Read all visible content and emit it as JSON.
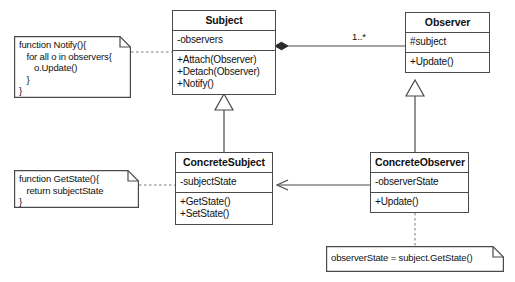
{
  "diagram": {
    "stroke_color": "#4a4a4a",
    "text_color": "#111111",
    "background": "#ffffff"
  },
  "classes": [
    {
      "key": "subject",
      "name": "Subject",
      "attributes": [
        "-observers"
      ],
      "operations": [
        "+Attach(Observer)",
        "+Detach(Observer)",
        "+Notify()"
      ]
    },
    {
      "key": "observer",
      "name": "Observer",
      "attributes": [
        "#subject"
      ],
      "operations": [
        "+Update()"
      ]
    },
    {
      "key": "concrete_subject",
      "name": "ConcreteSubject",
      "attributes": [
        "-subjectState"
      ],
      "operations": [
        "+GetState()",
        "+SetState()"
      ]
    },
    {
      "key": "concrete_observer",
      "name": "ConcreteObserver",
      "attributes": [
        "-observerState"
      ],
      "operations": [
        "+Update()"
      ]
    }
  ],
  "notes": [
    {
      "key": "notify_note",
      "text": "function Notify(){\n   for all o in observers{\n      o.Update()\n   }\n}"
    },
    {
      "key": "getstate_note",
      "text": "function GetState(){\n   return subjectState\n}"
    },
    {
      "key": "observerstate_note",
      "text": "observerState = subject.GetState()"
    }
  ],
  "edge_labels": {
    "subject_observer_multiplicity": "1..*"
  }
}
